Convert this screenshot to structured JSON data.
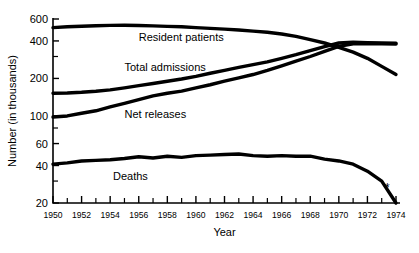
{
  "chart_data": {
    "type": "line",
    "title": "",
    "xlabel": "Year",
    "ylabel": "Number (in thousands)",
    "yscale": "log",
    "ylim": [
      20,
      600
    ],
    "xlim": [
      1950,
      1974
    ],
    "grid": false,
    "legend_position": "inline-labels",
    "ytick_labels": [
      "600",
      "400",
      "200",
      "100",
      "60",
      "40",
      "20"
    ],
    "ytick_values": [
      600,
      400,
      200,
      100,
      60,
      40,
      20
    ],
    "xtick_labels": [
      "1950",
      "1952",
      "1954",
      "1956",
      "1958",
      "1960",
      "1962",
      "1964",
      "1966",
      "1968",
      "1970",
      "1972",
      "1974"
    ],
    "xtick_values": [
      1950,
      1952,
      1954,
      1956,
      1958,
      1960,
      1962,
      1964,
      1966,
      1968,
      1970,
      1972,
      1974
    ],
    "x": [
      1950,
      1951,
      1952,
      1953,
      1954,
      1955,
      1956,
      1957,
      1958,
      1959,
      1960,
      1961,
      1962,
      1963,
      1964,
      1965,
      1966,
      1967,
      1968,
      1969,
      1970,
      1971,
      1972,
      1973,
      1974
    ],
    "series": [
      {
        "name": "Resident patients",
        "label": "Resident patients",
        "values": [
          512,
          520,
          525,
          530,
          533,
          535,
          532,
          528,
          524,
          520,
          512,
          505,
          498,
          490,
          480,
          470,
          455,
          435,
          410,
          385,
          355,
          325,
          290,
          250,
          215
        ],
        "label_x": 1956.0,
        "label_y": 430,
        "color": "#000000"
      },
      {
        "name": "Total admissions",
        "label": "Total admissions",
        "values": [
          152,
          153,
          155,
          158,
          162,
          168,
          175,
          182,
          190,
          198,
          208,
          220,
          232,
          245,
          258,
          272,
          290,
          310,
          335,
          360,
          385,
          390,
          388,
          385,
          383
        ],
        "label_x": 1955.0,
        "label_y": 248,
        "color": "#000000"
      },
      {
        "name": "Net releases",
        "label": "Net releases",
        "values": [
          98,
          100,
          105,
          110,
          118,
          126,
          135,
          145,
          152,
          158,
          168,
          178,
          190,
          202,
          215,
          232,
          252,
          275,
          300,
          330,
          362,
          380,
          382,
          380,
          378
        ],
        "label_x": 1955.0,
        "label_y": 104,
        "color": "#000000"
      },
      {
        "name": "Deaths",
        "label": "Deaths",
        "values": [
          41,
          42,
          43.5,
          44,
          44.5,
          45.5,
          47,
          46,
          47.5,
          46.5,
          48,
          48.5,
          49,
          49.5,
          48,
          47.5,
          48,
          47.5,
          47.5,
          45,
          43.5,
          41,
          36,
          30,
          20
        ],
        "label_x": 1954.2,
        "label_y": 33,
        "color": "#000000"
      }
    ],
    "annotations": [
      {
        "text": "*",
        "x": 1973.4,
        "y": 24.5,
        "name": "footnote-asterisk"
      }
    ]
  }
}
